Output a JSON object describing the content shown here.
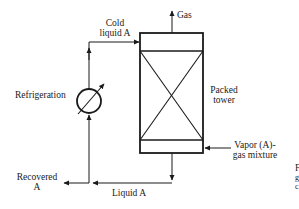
{
  "diagram": {
    "type": "process-flow",
    "labels": {
      "gas": "Gas",
      "cold_liquid_line1": "Cold",
      "cold_liquid_line2": "liquid  A",
      "refrigeration": "Refrigeration",
      "packed_tower_line1": "Packed",
      "packed_tower_line2": "tower",
      "vapor_line1": "Vapor (A)-",
      "vapor_line2": "gas mixture",
      "recovered_line1": "Recovered",
      "recovered_line2": "A",
      "liquid_a": "Liquid A",
      "cutoff_line1": "F",
      "cutoff_line2": "g",
      "cutoff_line3": "c"
    },
    "nodes": [
      {
        "id": "packed-tower",
        "label": "Packed tower"
      },
      {
        "id": "refrigeration",
        "label": "Refrigeration"
      }
    ],
    "edges": [
      {
        "from": "vapor-gas-mixture",
        "to": "packed-tower",
        "label": "Vapor (A)-gas mixture"
      },
      {
        "from": "packed-tower",
        "to": "gas-outlet",
        "label": "Gas"
      },
      {
        "from": "packed-tower",
        "to": "junction",
        "label": "Liquid A"
      },
      {
        "from": "junction",
        "to": "recovered",
        "label": "Recovered A"
      },
      {
        "from": "junction",
        "to": "refrigeration",
        "label": ""
      },
      {
        "from": "refrigeration",
        "to": "packed-tower",
        "label": "Cold liquid A"
      }
    ],
    "colors": {
      "line": "#1a1a1a",
      "background": "#ffffff"
    }
  }
}
